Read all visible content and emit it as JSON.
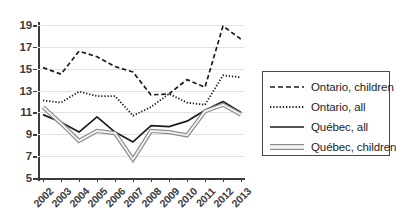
{
  "chart_data": {
    "type": "line",
    "title": "",
    "xlabel": "",
    "ylabel": "",
    "categories": [
      "2002",
      "2003",
      "2004",
      "2005",
      "2006",
      "2007",
      "2008",
      "2009",
      "2010",
      "2011",
      "2012",
      "2013"
    ],
    "x": [
      2002,
      2003,
      2004,
      2005,
      2006,
      2007,
      2008,
      2009,
      2010,
      2011,
      2012,
      2013
    ],
    "ylim": [
      5,
      19
    ],
    "yticks": [
      5,
      7,
      9,
      11,
      13,
      15,
      17,
      19
    ],
    "ytick_labels": [
      "5",
      "7",
      "9",
      "11",
      "13",
      "15",
      "17",
      "19"
    ],
    "grid": true,
    "legend_position": "right",
    "series": [
      {
        "name": "Ontario, children",
        "style": "dashed",
        "color": "#1d1d1d",
        "values": [
          15.1,
          14.5,
          16.6,
          16.1,
          15.2,
          14.7,
          12.6,
          12.7,
          14.0,
          13.3,
          18.9,
          17.7
        ]
      },
      {
        "name": "Ontario, all",
        "style": "dotted",
        "color": "#1d1d1d",
        "values": [
          12.1,
          11.9,
          12.9,
          12.5,
          12.5,
          10.7,
          11.5,
          12.7,
          11.9,
          11.7,
          14.4,
          14.2
        ]
      },
      {
        "name": "Québec, all",
        "style": "solid",
        "color": "#1d1d1d",
        "values": [
          10.8,
          10.1,
          9.2,
          10.6,
          9.2,
          8.3,
          9.8,
          9.7,
          10.2,
          11.2,
          12.0,
          11.0
        ]
      },
      {
        "name": "Québec, children",
        "style": "solid-gray",
        "color": "#a0a0a0",
        "values": [
          11.5,
          10.0,
          8.4,
          9.3,
          9.1,
          6.7,
          9.3,
          9.2,
          8.9,
          11.1,
          11.7,
          10.8
        ]
      }
    ]
  },
  "legend": {
    "entries": [
      {
        "label": "Ontario, children",
        "swatch": "dashed-line-swatch"
      },
      {
        "label": "Ontario, all",
        "swatch": "dotted-line-swatch"
      },
      {
        "label": "Québec, all",
        "swatch": "solid-line-swatch"
      },
      {
        "label": "Québec, children",
        "swatch": "gray-band-line-swatch"
      }
    ]
  }
}
